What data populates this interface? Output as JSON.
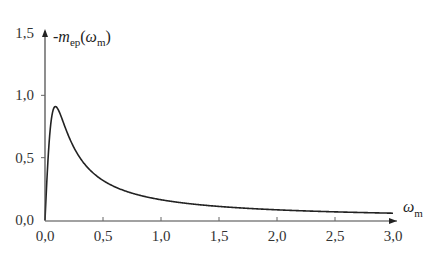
{
  "chart_data": {
    "type": "line",
    "title": "",
    "xlabel": "ωm",
    "ylabel": "-mep(ωm)",
    "xlabel_parts": {
      "main": "ω",
      "sub": "m"
    },
    "ylabel_parts": {
      "prefix": "-m",
      "sub": "ep",
      "open": "(",
      "arg": "ω",
      "argsub": "m",
      "close": ")"
    },
    "xlim": [
      0,
      3.0
    ],
    "ylim": [
      0,
      1.5
    ],
    "x_ticks": [
      0.0,
      0.5,
      1.0,
      1.5,
      2.0,
      2.5,
      3.0
    ],
    "x_tick_labels": [
      "0,0",
      "0,5",
      "1,0",
      "1,5",
      "2,0",
      "2,5",
      "3,0"
    ],
    "y_ticks": [
      0.0,
      0.5,
      1.0,
      1.5
    ],
    "y_tick_labels": [
      "0,0",
      "0,5",
      "1,0",
      "1,5"
    ],
    "grid": false,
    "legend": null,
    "series": [
      {
        "name": "-mep(ωm)",
        "color": "#222222",
        "x": [
          0.0,
          0.01,
          0.02,
          0.03,
          0.05,
          0.07,
          0.09,
          0.11,
          0.13,
          0.15,
          0.2,
          0.25,
          0.3,
          0.4,
          0.5,
          0.6,
          0.7,
          0.8,
          1.0,
          1.2,
          1.5,
          1.8,
          2.0,
          2.5,
          3.0
        ],
        "values": [
          0.0,
          0.2,
          0.38,
          0.54,
          0.77,
          0.89,
          0.91,
          0.9,
          0.86,
          0.82,
          0.7,
          0.6,
          0.52,
          0.4,
          0.32,
          0.27,
          0.23,
          0.2,
          0.16,
          0.14,
          0.11,
          0.09,
          0.08,
          0.066,
          0.055
        ]
      }
    ]
  }
}
